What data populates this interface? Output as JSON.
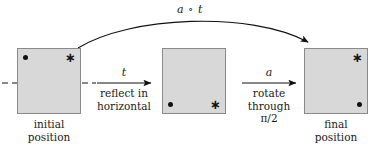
{
  "figure": {
    "type": "math-transformation-diagram",
    "composition_label": "a ∘ t",
    "panels": [
      {
        "id": "initial",
        "caption": "initial\nposition",
        "marks": [
          {
            "glyph": "dot",
            "corner": "top-left"
          },
          {
            "glyph": "asterisk",
            "corner": "top-right"
          }
        ],
        "overlay": "vertical-double-arrow",
        "axis": "dashed-horizontal"
      },
      {
        "id": "middle",
        "caption": "",
        "marks": [
          {
            "glyph": "dot",
            "corner": "bottom-left"
          },
          {
            "glyph": "asterisk",
            "corner": "bottom-right"
          }
        ],
        "overlay": "curved-rotation-arrow",
        "axis": "none"
      },
      {
        "id": "final",
        "caption": "final\nposition",
        "marks": [
          {
            "glyph": "asterisk",
            "corner": "top-right"
          },
          {
            "glyph": "dot",
            "corner": "bottom-right"
          }
        ],
        "overlay": "none",
        "axis": "none"
      }
    ],
    "transitions": [
      {
        "id": "t",
        "symbol": "t",
        "description": "reflect in\nhorizontal"
      },
      {
        "id": "a",
        "symbol": "a",
        "description": "rotate\nthrough\nπ/2"
      }
    ],
    "colors": {
      "square_fill": "#d8d8d8",
      "square_border": "#8a8a8a",
      "ink": "#111111",
      "background": "#ffffff"
    }
  },
  "glyphs": {
    "asterisk": "∗"
  }
}
